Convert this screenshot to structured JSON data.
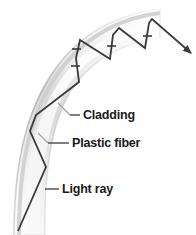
{
  "figure": {
    "type": "diagram",
    "background_color": "#ffffff",
    "width": 196,
    "height": 235
  },
  "fiber": {
    "name": "plastic-fiber-band",
    "shape": "curved-band",
    "description": "A shaded curved band arcing from lower-left upward and to the upper-right, representing the plastic optical fiber with its cladding.",
    "outer_edge_color": "#ffffff",
    "mid_shade_color": "#d6d6d6",
    "core_highlight_color": "#f7f7f7",
    "edge_shadow_color": "#9a9a9a",
    "band_width_px": 34
  },
  "light_ray": {
    "name": "light-ray-path",
    "color": "#3a3a3a",
    "stroke_width": 1.8,
    "description": "Zig-zag ray entering at the lower-left, reflecting off the fiber walls several times, then exiting at the upper-right.",
    "entry_point": [
      18,
      231
    ],
    "exit_point": [
      191,
      53
    ],
    "arrowhead_at_exit": true,
    "vertices": [
      [
        18,
        231
      ],
      [
        46,
        167
      ],
      [
        30,
        131
      ],
      [
        36,
        115
      ],
      [
        79,
        82
      ],
      [
        76,
        58
      ],
      [
        80,
        40
      ],
      [
        110,
        59
      ],
      [
        113,
        35
      ],
      [
        119,
        28
      ],
      [
        145,
        48
      ],
      [
        149,
        23
      ],
      [
        152,
        19
      ],
      [
        191,
        53
      ]
    ],
    "tick_marks": [
      [
        75,
        66
      ],
      [
        76,
        49
      ],
      [
        111,
        46
      ],
      [
        147,
        36
      ]
    ]
  },
  "labels": [
    {
      "id": "cladding",
      "text": "Cladding",
      "text_x": 83,
      "text_y": 119,
      "leader_x1": 70,
      "leader_y1": 115,
      "leader_x2": 80,
      "leader_y2": 115,
      "pointer_x": 60,
      "pointer_y": 104,
      "leader_color": "#3a3a3a"
    },
    {
      "id": "plastic-fiber",
      "text": "Plastic fiber",
      "text_x": 72,
      "text_y": 147,
      "leader_x1": 48,
      "leader_y1": 143,
      "leader_x2": 69,
      "leader_y2": 143,
      "pointer_x": 40,
      "pointer_y": 136,
      "leader_color": "#3a3a3a"
    },
    {
      "id": "light-ray",
      "text": "Light ray",
      "text_x": 62,
      "text_y": 193,
      "leader_x1": 45,
      "leader_y1": 189,
      "leader_x2": 59,
      "leader_y2": 189,
      "pointer_x": 38,
      "pointer_y": 189,
      "leader_color": "#3a3a3a"
    }
  ]
}
